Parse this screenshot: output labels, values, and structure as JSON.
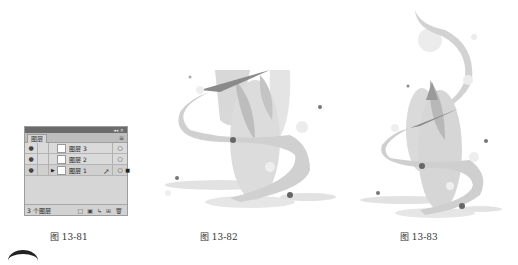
{
  "layers_panel": {
    "tab_label": "图层",
    "topbar_controls": "◂◂ ✕",
    "menu_icon": "≡",
    "layers": [
      {
        "name": "图层 3",
        "visible_icon": "●",
        "expand_icon": "",
        "target_icon": "○"
      },
      {
        "name": "图层 2",
        "visible_icon": "●",
        "expand_icon": "",
        "target_icon": "○"
      },
      {
        "name": "图层 1",
        "visible_icon": "●",
        "expand_icon": "▶",
        "target_icon": "○"
      }
    ],
    "layer_count": "3 个图层",
    "bottom_icons": [
      "□",
      "▣",
      "↳",
      "⊞",
      "🗑"
    ]
  },
  "captions": {
    "fig1": "图 13-81",
    "fig2": "图 13-82",
    "fig3": "图 13-83"
  },
  "colors": {
    "light_gray": "#d9d9d9",
    "mid_gray": "#bcbcbc",
    "dark_gray": "#7a7a7a",
    "dot": "#555555"
  }
}
